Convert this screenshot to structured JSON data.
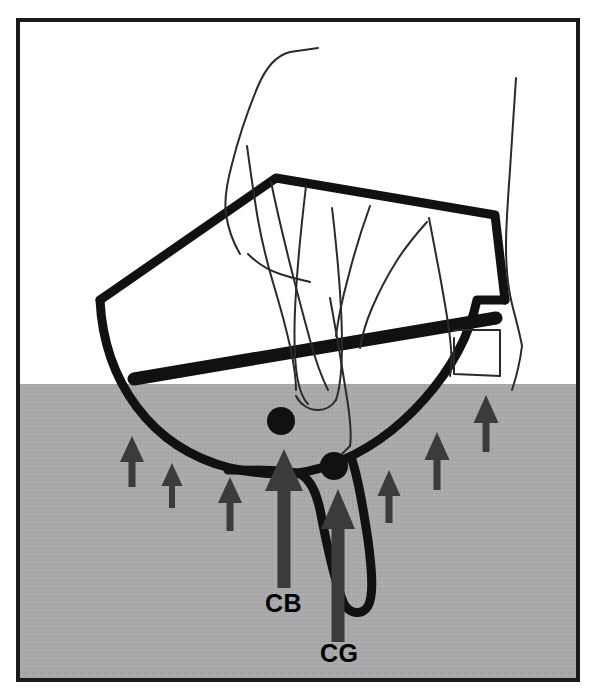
{
  "figure": {
    "kind": "technical-line-diagram",
    "canvas": {
      "width": 594,
      "height": 697,
      "background": "#ffffff"
    },
    "frame": {
      "name": "outer-border",
      "x": 18,
      "y": 20,
      "width": 560,
      "height": 660,
      "stroke": "#1a1a1a",
      "stroke_width": 4,
      "fill": "none"
    },
    "water": {
      "name": "water-region",
      "label": "water",
      "surface_y": 384,
      "fill": "#a9a9a9",
      "x": 20,
      "width": 556,
      "height": 294
    },
    "colors": {
      "ink": "#111111",
      "water_gray": "#a9a9a9",
      "arrow_dark": "#3b3b3b",
      "paper": "#ffffff"
    },
    "markers": [
      {
        "id": "cb",
        "name": "centre-of-buoyancy-dot",
        "label": "CB",
        "meaning": "Centre of Buoyancy",
        "dot": {
          "cx": 281,
          "cy": 421,
          "r": 14
        },
        "label_pos": {
          "x": 265,
          "y": 612
        },
        "arrow": {
          "name": "buoyancy-force-arrow",
          "x": 284,
          "tip_y": 449,
          "base_y": 588,
          "shaft_width": 13,
          "head_width": 38,
          "head_height": 42
        }
      },
      {
        "id": "cg",
        "name": "centre-of-gravity-dot",
        "label": "CG",
        "meaning": "Centre of Gravity",
        "dot": {
          "cx": 334,
          "cy": 466,
          "r": 14
        },
        "label_pos": {
          "x": 320,
          "y": 662
        },
        "arrow": {
          "name": "gravity-reference-arrow",
          "x": 338,
          "tip_y": 489,
          "base_y": 642,
          "shaft_width": 13,
          "head_width": 34,
          "head_height": 40
        }
      }
    ],
    "pressure_arrows": {
      "name": "buoyancy-pressure-arrows",
      "description": "small upward arrows representing water pressure on the hull",
      "count": 6,
      "items": [
        {
          "x": 132,
          "tip_y": 436,
          "base_y": 487,
          "shaft_width": 7,
          "head_width": 24,
          "head_height": 26
        },
        {
          "x": 172,
          "tip_y": 463,
          "base_y": 508,
          "shaft_width": 6,
          "head_width": 21,
          "head_height": 23
        },
        {
          "x": 230,
          "tip_y": 477,
          "base_y": 531,
          "shaft_width": 7,
          "head_width": 24,
          "head_height": 26
        },
        {
          "x": 389,
          "tip_y": 470,
          "base_y": 523,
          "shaft_width": 7,
          "head_width": 23,
          "head_height": 26
        },
        {
          "x": 437,
          "tip_y": 432,
          "base_y": 490,
          "shaft_width": 7,
          "head_width": 25,
          "head_height": 28
        },
        {
          "x": 486,
          "tip_y": 395,
          "base_y": 452,
          "shaft_width": 7,
          "head_width": 25,
          "head_height": 28
        }
      ]
    },
    "hull": {
      "name": "boat-hull-outline",
      "stroke": "#111111",
      "stroke_width": 9,
      "deck_line": "M 100 300 L 276 178 L 495 215 L 505 300",
      "hull_bottom": "M 100 300 C 104 380 150 448 230 468 C 270 477 300 476 330 465 C 400 440 462 370 477 300 L 505 300",
      "sheer_band": "M 134 379 L 496 318",
      "keel": "M 228 470 C 262 470 286 470 300 474 C 312 480 318 496 322 520 C 330 560 336 586 344 604 C 350 614 362 616 368 606 C 374 596 372 570 368 540 C 362 500 356 472 352 460"
    },
    "hand_sketch": {
      "name": "hand-holding-hull-sketch",
      "description": "thin pencil outline of a hand holding the hull",
      "stroke": "#2a2a2a",
      "stroke_width": 2,
      "paths": [
        "M 318 48 L 290 52 C 275 56 266 68 258 86 C 248 110 238 140 232 164 C 226 186 224 200 226 214 C 228 228 234 244 240 254",
        "M 247 146 C 250 168 254 196 258 220 C 262 242 268 266 274 286 C 280 306 286 328 290 346 C 294 364 296 378 296 390",
        "M 248 254 C 256 262 268 270 280 274 C 292 278 302 280 310 282",
        "M 271 182 C 276 206 283 236 290 264 C 297 292 304 318 310 340 C 316 362 322 378 328 390",
        "M 306 186 C 302 220 298 258 296 292 C 294 322 294 348 296 368 C 298 386 302 398 308 404",
        "M 296 396 C 300 404 308 410 318 410 C 326 410 332 406 336 400",
        "M 336 400 C 340 388 342 368 342 344 C 342 318 340 290 338 266 C 336 244 334 224 332 208",
        "M 370 206 C 362 228 354 254 348 278 C 342 300 338 320 336 336",
        "M 427 222 C 418 232 406 246 396 262 C 386 278 378 294 372 308 C 366 322 362 336 360 348",
        "M 429 218 C 432 234 436 254 440 276 C 444 298 448 320 450 338 C 452 354 452 366 450 376",
        "M 454 338 C 454 352 454 364 454 374 L 500 376 L 500 330 L 454 330",
        "M 516 78 C 514 106 512 140 510 170 C 508 198 506 224 506 246 C 506 268 508 288 512 304 C 516 320 520 334 522 346",
        "M 522 346 C 520 362 516 378 512 390",
        "M 330 298 C 336 330 342 366 346 392 C 350 416 352 434 350 446",
        "M 350 446 L 334 462"
      ]
    },
    "labels": [
      {
        "name": "cb-label",
        "text": "CB",
        "x": 265,
        "y": 612
      },
      {
        "name": "cg-label",
        "text": "CG",
        "x": 320,
        "y": 662
      }
    ]
  }
}
